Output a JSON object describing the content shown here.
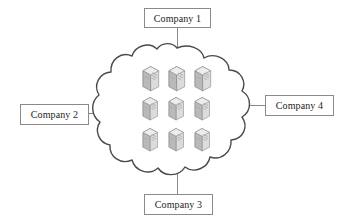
{
  "diagram": {
    "canvas": {
      "width": 346,
      "height": 224,
      "background": "#ffffff"
    },
    "cloud": {
      "name": "cloud",
      "stroke": "#4a4a4a",
      "fill": "#ffffff",
      "stroke_width": 1.4,
      "center_x": 175,
      "center_y": 109,
      "servers_count": 9,
      "server_grid": {
        "rows": 3,
        "cols": 3
      },
      "server_icon_name": "server-icon",
      "server_colors": {
        "front": "#d9d9d9",
        "top": "#eeeeee",
        "side": "#bdbdbd",
        "outline": "#8c8c8c",
        "detail": "#9a9a9a"
      }
    },
    "nodes": [
      {
        "id": "company-1",
        "label": "Company 1",
        "position": "top"
      },
      {
        "id": "company-2",
        "label": "Company 2",
        "position": "left"
      },
      {
        "id": "company-3",
        "label": "Company 3",
        "position": "bottom"
      },
      {
        "id": "company-4",
        "label": "Company 4",
        "position": "right"
      }
    ],
    "connectors": [
      {
        "id": "connector-company-1",
        "from": "company-1",
        "to": "cloud",
        "orientation": "vertical"
      },
      {
        "id": "connector-company-2",
        "from": "company-2",
        "to": "cloud",
        "orientation": "horizontal"
      },
      {
        "id": "connector-company-3",
        "from": "company-3",
        "to": "cloud",
        "orientation": "vertical"
      },
      {
        "id": "connector-company-4",
        "from": "company-4",
        "to": "cloud",
        "orientation": "horizontal"
      }
    ],
    "connector_color": "#8a8a8a",
    "box_border_color": "#8a8a8a",
    "text_color": "#1d1d1d"
  }
}
